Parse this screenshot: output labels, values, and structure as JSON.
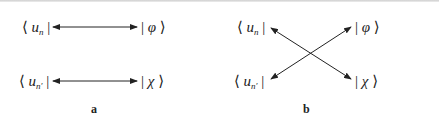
{
  "diagram": {
    "panels": [
      {
        "caption": "a",
        "left_labels": [
          {
            "bra_open": "⟨",
            "symbol": "u",
            "subscript": "n",
            "bra_close": "|"
          },
          {
            "bra_open": "⟨",
            "symbol": "u",
            "subscript": "n′",
            "bra_close": "|"
          }
        ],
        "right_labels": [
          {
            "ket_open": "|",
            "symbol": "φ",
            "ket_close": "⟩"
          },
          {
            "ket_open": "|",
            "symbol": "χ",
            "ket_close": "⟩"
          }
        ],
        "connections": [
          {
            "from": "⟨u_n|",
            "to": "|φ⟩",
            "type": "double-arrow"
          },
          {
            "from": "⟨u_n′|",
            "to": "|χ⟩",
            "type": "double-arrow"
          }
        ]
      },
      {
        "caption": "b",
        "left_labels": [
          {
            "bra_open": "⟨",
            "symbol": "u",
            "subscript": "n",
            "bra_close": "|"
          },
          {
            "bra_open": "⟨",
            "symbol": "u",
            "subscript": "n′",
            "bra_close": "|"
          }
        ],
        "right_labels": [
          {
            "ket_open": "|",
            "symbol": "φ",
            "ket_close": "⟩"
          },
          {
            "ket_open": "|",
            "symbol": "χ",
            "ket_close": "⟩"
          }
        ],
        "connections": [
          {
            "from": "⟨u_n|",
            "to": "|χ⟩",
            "type": "double-arrow"
          },
          {
            "from": "⟨u_n′|",
            "to": "|φ⟩",
            "type": "double-arrow"
          }
        ]
      }
    ]
  }
}
